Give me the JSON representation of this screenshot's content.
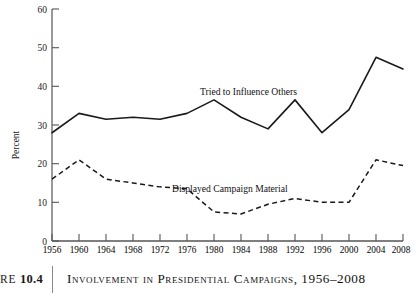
{
  "caption": {
    "figure_label": "RE",
    "figure_number": "10.4",
    "title": "Involvement in Presidential Campaigns, 1956–2008"
  },
  "axes": {
    "ylabel": "Percent",
    "yticks": [
      "0",
      "10",
      "20",
      "30",
      "40",
      "50",
      "60"
    ],
    "xticks": [
      "1956",
      "1960",
      "1964",
      "1968",
      "1972",
      "1976",
      "1980",
      "1984",
      "1988",
      "1992",
      "1996",
      "2000",
      "2004",
      "2008"
    ]
  },
  "annotations": {
    "series1_label": "Tried to Influence Others",
    "series2_label": "Displayed Campaign Material"
  },
  "colors": {
    "line": "#1a1a1a",
    "axis": "#555555",
    "background": "#ffffff",
    "rule": "#8a8a8a"
  },
  "chart_data": {
    "type": "line",
    "title": "Involvement in Presidential Campaigns, 1956–2008",
    "xlabel": "",
    "ylabel": "Percent",
    "ylim": [
      0,
      60
    ],
    "ytick_step": 10,
    "grid": false,
    "legend": "inline-annotations",
    "categories": [
      1956,
      1960,
      1964,
      1968,
      1972,
      1976,
      1980,
      1984,
      1988,
      1992,
      1996,
      2000,
      2004,
      2008
    ],
    "series": [
      {
        "name": "Tried to Influence Others",
        "style": "solid",
        "values": [
          28,
          33,
          31.5,
          32,
          31.5,
          33,
          36.5,
          32,
          29,
          36.5,
          28,
          34,
          47.5,
          44.5
        ]
      },
      {
        "name": "Displayed Campaign Material",
        "style": "dashed",
        "values": [
          16,
          21,
          16,
          15,
          14,
          13.5,
          7.5,
          7,
          9.5,
          11,
          10,
          10,
          21,
          19.5
        ]
      }
    ]
  }
}
